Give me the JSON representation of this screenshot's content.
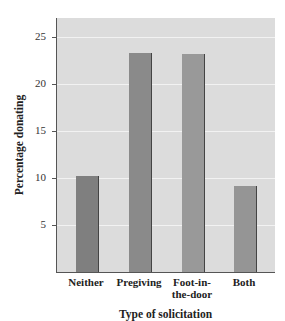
{
  "chart_data": {
    "type": "bar",
    "title": "",
    "xlabel": "Type of solicitation",
    "ylabel": "Percentage donating",
    "categories": [
      "Neither",
      "Pregiving",
      "Foot-in-the-door",
      "Both"
    ],
    "category_labels": [
      [
        "Neither"
      ],
      [
        "Pregiving"
      ],
      [
        "Foot-in-",
        "the-door"
      ],
      [
        "Both"
      ]
    ],
    "values": [
      10.2,
      23.3,
      23.2,
      9.1
    ],
    "yticks": [
      5,
      10,
      15,
      20,
      25
    ],
    "ylim": [
      0,
      27
    ],
    "grid": true,
    "legend": null,
    "colors": {
      "plot_background": "#dcdcdc",
      "gridline": "#f2f2f2",
      "bars": [
        "#7f7f7f",
        "#8a8a8a",
        "#999999",
        "#959595"
      ]
    }
  }
}
